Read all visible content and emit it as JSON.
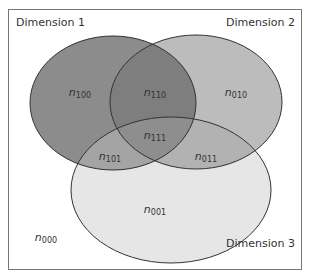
{
  "diagram": {
    "type": "venn",
    "sets": [
      {
        "id": "dim1",
        "label": "Dimension 1",
        "fill": "#8c8c8c"
      },
      {
        "id": "dim2",
        "label": "Dimension 2",
        "fill": "#bcbcbc"
      },
      {
        "id": "dim3",
        "label": "Dimension 3",
        "fill": "#e6e6e6"
      }
    ],
    "regions": [
      {
        "id": "r100",
        "base": "n",
        "sub": "100"
      },
      {
        "id": "r010",
        "base": "n",
        "sub": "010"
      },
      {
        "id": "r110",
        "base": "n",
        "sub": "110"
      },
      {
        "id": "r111",
        "base": "n",
        "sub": "111"
      },
      {
        "id": "r101",
        "base": "n",
        "sub": "101"
      },
      {
        "id": "r011",
        "base": "n",
        "sub": "011"
      },
      {
        "id": "r001",
        "base": "n",
        "sub": "001"
      },
      {
        "id": "r000",
        "base": "n",
        "sub": "000"
      }
    ],
    "colors": {
      "frame": "#777777",
      "stroke": "#333333",
      "overlap12": "#7a7a7a",
      "overlap13": "#9e9e9e",
      "overlap23": "#b0b0b0",
      "overlap123": "#8a8a8a"
    }
  }
}
